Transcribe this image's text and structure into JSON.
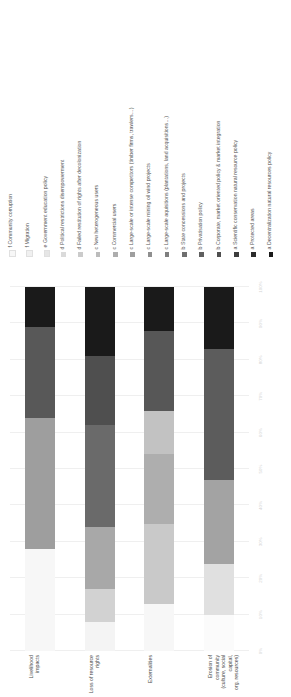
{
  "chart_data": {
    "type": "bar",
    "subtype": "stacked-100-percent",
    "title": "",
    "xlabel": "",
    "ylabel": "",
    "ylim": [
      0,
      100
    ],
    "ytick_labels": [
      "100%",
      "90%",
      "80%",
      "70%",
      "60%",
      "50%",
      "40%",
      "30%",
      "20%",
      "10%",
      "0%"
    ],
    "grid": true,
    "legend_position": "right",
    "orientation": "rotated-90",
    "categories": [
      "Livelihood impacts",
      "Loss of resource rights",
      "Externalities",
      "Erosion of community\n(culture, social capital,\norg. resources)"
    ],
    "series": [
      {
        "name": "a Decentralization natural resources policy",
        "color": "#1a1a1a",
        "values": [
          11,
          19,
          12,
          17
        ]
      },
      {
        "name": "a Protected areas",
        "color": "#2b2b2b",
        "values": [
          0,
          0,
          0,
          0
        ]
      },
      {
        "name": "a Scientific conservation natural resource policy",
        "color": "#3d3d3d",
        "values": [
          0,
          0,
          0,
          0
        ]
      },
      {
        "name": "b Corporate, market oriented policy & market integration",
        "color": "#4f4f4f",
        "values": [
          25,
          25,
          17,
          25
        ]
      },
      {
        "name": "b Privatisation policy",
        "color": "#5f5f5f",
        "values": [
          0,
          0,
          0,
          0
        ]
      },
      {
        "name": "b State concessions and projects",
        "color": "#6f6f6f",
        "values": [
          0,
          0,
          0,
          0
        ]
      },
      {
        "name": "c Large-scale aquisitions (plantations, land acquisitions...)",
        "color": "#7f7f7f",
        "values": [
          36,
          26,
          0,
          0
        ]
      },
      {
        "name": "c Large-scale mining oil wind projects",
        "color": "#8f8f8f",
        "values": [
          0,
          0,
          0,
          23
        ]
      },
      {
        "name": "c Large-scale or intense competitors (timber firms, trawlers…)",
        "color": "#9e9e9e",
        "values": [
          0,
          0,
          36,
          0
        ]
      },
      {
        "name": "c Commercial users",
        "color": "#adadad",
        "values": [
          0,
          10,
          0,
          0
        ]
      },
      {
        "name": "c New heterogeneous users",
        "color": "#bcbcbc",
        "values": [
          0,
          0,
          0,
          0
        ]
      },
      {
        "name": "d Failed restitution of rights after decolonization",
        "color": "#cbcbcb",
        "values": [
          0,
          0,
          22,
          0
        ]
      },
      {
        "name": "d Political restrictions disempowerment",
        "color": "#dadada",
        "values": [
          0,
          8,
          0,
          11
        ]
      },
      {
        "name": "e Government education policy",
        "color": "#e6e6e6",
        "values": [
          0,
          0,
          0,
          0
        ]
      },
      {
        "name": "f Migration",
        "color": "#f0f0f0",
        "values": [
          0,
          0,
          0,
          0
        ]
      },
      {
        "name": "f Community corruption",
        "color": "#f7f7f7",
        "values": [
          28,
          12,
          13,
          24
        ]
      }
    ],
    "legend_entries": [
      {
        "label": "f Community corruption",
        "color": "#f7f7f7"
      },
      {
        "label": "f Migration",
        "color": "#f0f0f0"
      },
      {
        "label": "e Government education policy",
        "color": "#e6e6e6"
      },
      {
        "label": "d Political restrictions disempowerment",
        "color": "#dadada"
      },
      {
        "label": "d Failed restitution of rights after decolonization",
        "color": "#cbcbcb"
      },
      {
        "label": "c New heterogeneous users",
        "color": "#bcbcbc"
      },
      {
        "label": "c Commercial users",
        "color": "#adadad"
      },
      {
        "label": "c Large-scale or intense competitors (timber firms, trawlers…)",
        "color": "#9e9e9e"
      },
      {
        "label": "c Large-scale mining oil wind projects",
        "color": "#8f8f8f"
      },
      {
        "label": "c Large-scale aquisitions (plantations, land acquisitions…)",
        "color": "#7f7f7f"
      },
      {
        "label": "b State concessions and projects",
        "color": "#6f6f6f"
      },
      {
        "label": "b Privatisation policy",
        "color": "#5f5f5f"
      },
      {
        "label": "b Corporate, market oriented policy & market integration",
        "color": "#4f4f4f"
      },
      {
        "label": "a Scientific conservation natural resource policy",
        "color": "#3d3d3d"
      },
      {
        "label": "a Protected areas",
        "color": "#2b2b2b"
      },
      {
        "label": "a Decentralization natural resources policy",
        "color": "#1a1a1a"
      }
    ],
    "bars": [
      {
        "category": "Livelihood impacts",
        "segments": [
          {
            "label": "f Community corruption",
            "color": "#f7f7f7",
            "value": 28
          },
          {
            "label": "c Large-scale aquisitions (plantations, land acquisitions…)",
            "color": "#9e9e9e",
            "value": 36
          },
          {
            "label": "b Corporate, market oriented policy & market integration",
            "color": "#585858",
            "value": 25
          },
          {
            "label": "a Decentralization natural resources policy",
            "color": "#1a1a1a",
            "value": 11
          }
        ]
      },
      {
        "category": "Loss of resource rights",
        "segments": [
          {
            "label": "f Community corruption",
            "color": "#f4f4f4",
            "value": 8
          },
          {
            "label": "d Political restrictions disempowerment",
            "color": "#d2d2d2",
            "value": 9
          },
          {
            "label": "c Commercial users",
            "color": "#a8a8a8",
            "value": 17
          },
          {
            "label": "c Large-scale aquisitions (plantations, land acquisitions…)",
            "color": "#6a6a6a",
            "value": 28
          },
          {
            "label": "b Corporate, market oriented policy & market integration",
            "color": "#4f4f4f",
            "value": 19
          },
          {
            "label": "a Decentralization natural resources policy",
            "color": "#1a1a1a",
            "value": 19
          }
        ]
      },
      {
        "category": "Externalities",
        "segments": [
          {
            "label": "f Community corruption",
            "color": "#f7f7f7",
            "value": 13
          },
          {
            "label": "d Failed restitution of rights after decolonization",
            "color": "#c9c9c9",
            "value": 22
          },
          {
            "label": "c New heterogeneous users",
            "color": "#aeaeae",
            "value": 19
          },
          {
            "label": "c Large-scale or intense competitors (timber firms, trawlers…)",
            "color": "#c2c2c2",
            "value": 12
          },
          {
            "label": "b Corporate, market oriented policy & market integration",
            "color": "#575757",
            "value": 22
          },
          {
            "label": "a Decentralization natural resources policy",
            "color": "#1a1a1a",
            "value": 12
          }
        ]
      },
      {
        "category": "Erosion of community\n(culture, social capital,\norg. resources)",
        "segments": [
          {
            "label": "f Community corruption",
            "color": "#fbfbfb",
            "value": 10
          },
          {
            "label": "d Political restrictions disempowerment",
            "color": "#e0e0e0",
            "value": 14
          },
          {
            "label": "c Large-scale mining oil wind projects",
            "color": "#a3a3a3",
            "value": 23
          },
          {
            "label": "b Corporate, market oriented policy & market integration",
            "color": "#5c5c5c",
            "value": 36
          },
          {
            "label": "a Decentralization natural resources policy",
            "color": "#1a1a1a",
            "value": 17
          }
        ]
      }
    ]
  }
}
